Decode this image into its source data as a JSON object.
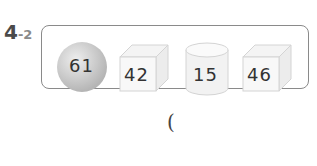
{
  "question": {
    "number": "4",
    "sub_number": "-2"
  },
  "shapes": [
    {
      "type": "sphere",
      "value": "61"
    },
    {
      "type": "cube",
      "value": "42"
    },
    {
      "type": "cylinder",
      "value": "15"
    },
    {
      "type": "cube",
      "value": "46"
    }
  ],
  "answer": {
    "open_paren": "("
  },
  "colors": {
    "frame_border": "#8a8a8a",
    "sphere_fill": "#cfcfcf",
    "shape_stroke": "#d6d6d6",
    "text": "#333333"
  }
}
